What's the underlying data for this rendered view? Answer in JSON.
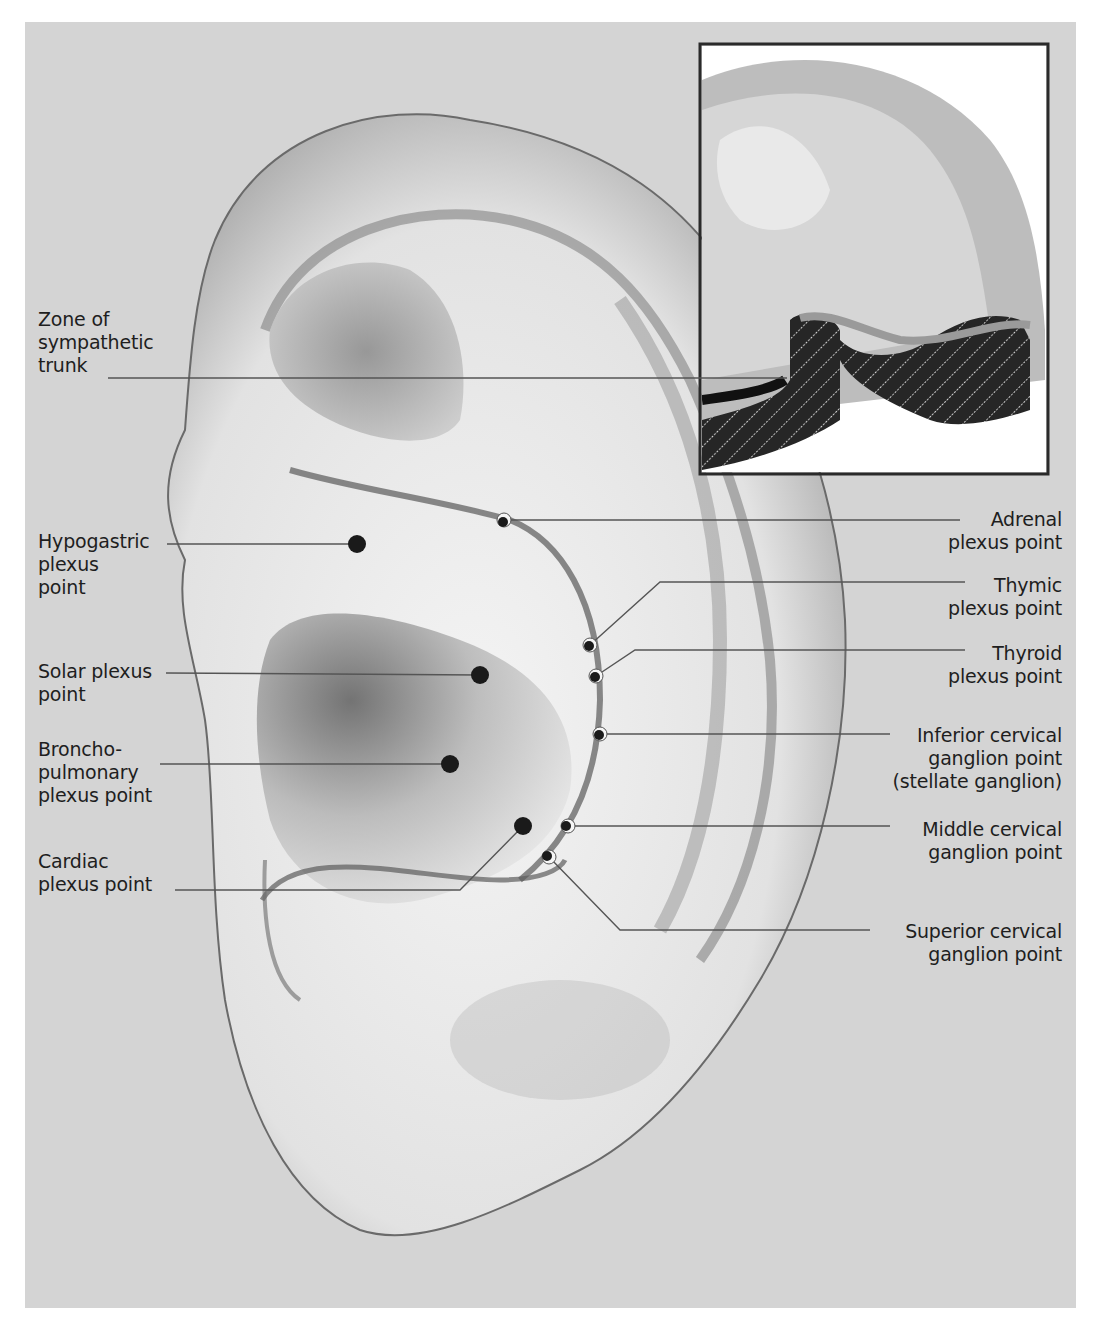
{
  "figure": {
    "background_color": "#d4d4d4",
    "inset_border_color": "#2a2a2a",
    "marker_color": "#1a1a1a",
    "leader_line_color": "#555555"
  },
  "labels": {
    "left": [
      {
        "id": "sympathetic_trunk",
        "text": "Zone of\nsympathetic\ntrunk"
      },
      {
        "id": "hypogastric",
        "text": "Hypogastric\nplexus\npoint"
      },
      {
        "id": "solar",
        "text": "Solar plexus\npoint"
      },
      {
        "id": "bronchopulmonary",
        "text": "Broncho-\npulmonary\nplexus point"
      },
      {
        "id": "cardiac",
        "text": "Cardiac\nplexus point"
      }
    ],
    "right": [
      {
        "id": "adrenal",
        "text": "Adrenal\nplexus point"
      },
      {
        "id": "thymic",
        "text": "Thymic\nplexus point"
      },
      {
        "id": "thyroid",
        "text": "Thyroid\nplexus point"
      },
      {
        "id": "inferior_cervical",
        "text": "Inferior cervical\nganglion point\n(stellate ganglion)"
      },
      {
        "id": "middle_cervical",
        "text": "Middle cervical\nganglion point"
      },
      {
        "id": "superior_cervical",
        "text": "Superior cervical\nganglion point"
      }
    ]
  },
  "points": [
    {
      "id": "hypogastric",
      "type": "solid",
      "x": 357,
      "y": 544
    },
    {
      "id": "solar",
      "type": "solid",
      "x": 480,
      "y": 675
    },
    {
      "id": "bronchopulmonary",
      "type": "solid",
      "x": 450,
      "y": 764
    },
    {
      "id": "cardiac",
      "type": "solid",
      "x": 523,
      "y": 826
    },
    {
      "id": "adrenal",
      "type": "ringed",
      "x": 504,
      "y": 520
    },
    {
      "id": "thymic",
      "type": "ringed",
      "x": 590,
      "y": 645
    },
    {
      "id": "thyroid",
      "type": "ringed",
      "x": 596,
      "y": 676
    },
    {
      "id": "inferior_cervical",
      "type": "ringed",
      "x": 600,
      "y": 734
    },
    {
      "id": "middle_cervical",
      "type": "ringed",
      "x": 568,
      "y": 826
    },
    {
      "id": "superior_cervical",
      "type": "ringed",
      "x": 549,
      "y": 857
    }
  ]
}
